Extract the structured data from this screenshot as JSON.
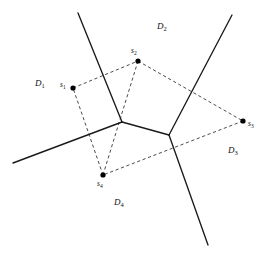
{
  "figure": {
    "type": "voronoi-delaunay-diagram",
    "width": 265,
    "height": 263,
    "background_color": "#ffffff",
    "line_color": "#1a1a1a",
    "dash_color": "#2a2a2a",
    "site_color": "#000000"
  },
  "sites": [
    {
      "id": "s1",
      "label": "s",
      "sub": "1",
      "x": 73,
      "y": 88,
      "label_x": 60,
      "label_y": 81
    },
    {
      "id": "s2",
      "label": "s",
      "sub": "2",
      "x": 138,
      "y": 61,
      "label_x": 131,
      "label_y": 47
    },
    {
      "id": "s3",
      "label": "s",
      "sub": "3",
      "x": 243,
      "y": 121,
      "label_x": 248,
      "label_y": 120
    },
    {
      "id": "s4",
      "label": "s",
      "sub": "4",
      "x": 103,
      "y": 175,
      "label_x": 97,
      "label_y": 180
    }
  ],
  "regions": [
    {
      "id": "D1",
      "label": "D",
      "sub": "1",
      "label_x": 35,
      "label_y": 79
    },
    {
      "id": "D2",
      "label": "D",
      "sub": "2",
      "label_x": 157,
      "label_y": 22
    },
    {
      "id": "D3",
      "label": "D",
      "sub": "3",
      "label_x": 228,
      "label_y": 146
    },
    {
      "id": "D4",
      "label": "D",
      "sub": "4",
      "label_x": 114,
      "label_y": 198
    }
  ],
  "voronoi_vertices": [
    {
      "id": "v1",
      "x": 122,
      "y": 122
    },
    {
      "id": "v2",
      "x": 169,
      "y": 135
    }
  ],
  "voronoi_edges": [
    {
      "id": "edge-v1-v2",
      "kind": "segment",
      "points": "122,122 169,135"
    },
    {
      "id": "ray-upper-left",
      "kind": "ray",
      "points": "122,122 78,13"
    },
    {
      "id": "ray-lower-left",
      "kind": "ray",
      "points": "122,122 13,163"
    },
    {
      "id": "ray-upper-right",
      "kind": "ray",
      "points": "169,135 232,15"
    },
    {
      "id": "ray-lower-right",
      "kind": "ray",
      "points": "169,135 208,245"
    }
  ],
  "delaunay_edges": [
    {
      "id": "edge-s1-s2",
      "points": "73,88 138,61"
    },
    {
      "id": "edge-s2-s3",
      "points": "138,61 243,121"
    },
    {
      "id": "edge-s3-s4",
      "points": "243,121 103,175"
    },
    {
      "id": "edge-s4-s1",
      "points": "103,175 73,88"
    },
    {
      "id": "edge-s2-s4",
      "points": "138,61 103,175"
    }
  ]
}
